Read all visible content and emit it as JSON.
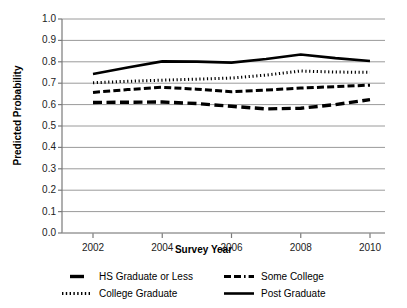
{
  "chart_data": {
    "type": "line",
    "title": "",
    "xlabel": "Survey Year",
    "ylabel": "Predicted Probability",
    "xlim": [
      2001.5,
      2010.5
    ],
    "ylim": [
      0.0,
      1.0
    ],
    "grid": "horizontal",
    "legend_position": "bottom",
    "x": [
      2002,
      2003,
      2004,
      2005,
      2006,
      2007,
      2008,
      2009,
      2010
    ],
    "xticks": [
      "2002",
      "2004",
      "2006",
      "2008",
      "2010"
    ],
    "xtick_values": [
      2002,
      2004,
      2006,
      2008,
      2010
    ],
    "yticks": [
      "0.0",
      "0.1",
      "0.2",
      "0.3",
      "0.4",
      "0.5",
      "0.6",
      "0.7",
      "0.8",
      "0.9",
      "1.0"
    ],
    "ytick_values": [
      0.0,
      0.1,
      0.2,
      0.3,
      0.4,
      0.5,
      0.6,
      0.7,
      0.8,
      0.9,
      1.0
    ],
    "series": [
      {
        "name": "HS Graduate or Less",
        "style": "thick-dash",
        "color": "#000000",
        "values": [
          0.61,
          0.611,
          0.612,
          0.605,
          0.592,
          0.58,
          0.583,
          0.6,
          0.623
        ]
      },
      {
        "name": "Some College",
        "style": "dash-dot",
        "color": "#000000",
        "values": [
          0.657,
          0.67,
          0.681,
          0.672,
          0.66,
          0.668,
          0.677,
          0.684,
          0.691
        ]
      },
      {
        "name": "College Graduate",
        "style": "dotted",
        "color": "#000000",
        "values": [
          0.702,
          0.709,
          0.714,
          0.719,
          0.724,
          0.738,
          0.757,
          0.752,
          0.751
        ]
      },
      {
        "name": "Post Graduate",
        "style": "solid",
        "color": "#000000",
        "values": [
          0.743,
          0.773,
          0.802,
          0.801,
          0.796,
          0.813,
          0.834,
          0.817,
          0.804
        ]
      }
    ]
  },
  "legend": {
    "entries": [
      {
        "label": "HS Graduate or Less",
        "style": "thick-dash"
      },
      {
        "label": "Some College",
        "style": "dash-dot"
      },
      {
        "label": "College Graduate",
        "style": "dotted"
      },
      {
        "label": "Post Graduate",
        "style": "solid"
      }
    ]
  },
  "colors": {
    "line": "#000000",
    "grid": "#9a9a9a",
    "axis": "#7a7a7a",
    "background": "#ffffff",
    "text": "#1a1a1a"
  }
}
